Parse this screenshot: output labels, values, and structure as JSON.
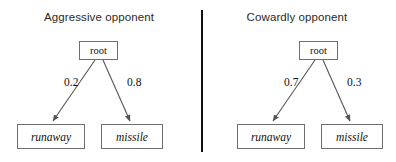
{
  "figure": {
    "background_color": "#ffffff",
    "line_color": "#555555",
    "box_border_color": "#6e6e6e",
    "divider_color": "#111111",
    "divider": "vertical-separator"
  },
  "panels": [
    {
      "id": "aggressive",
      "title": "Aggressive opponent",
      "root": {
        "label": "root"
      },
      "branches": [
        {
          "probability": "0.2",
          "target": "runaway"
        },
        {
          "probability": "0.8",
          "target": "missile"
        }
      ],
      "leaves": [
        {
          "id": "runaway",
          "label": "runaway"
        },
        {
          "id": "missile",
          "label": "missile"
        }
      ]
    },
    {
      "id": "cowardly",
      "title": "Cowardly opponent",
      "root": {
        "label": "root"
      },
      "branches": [
        {
          "probability": "0.7",
          "target": "runaway"
        },
        {
          "probability": "0.3",
          "target": "missile"
        }
      ],
      "leaves": [
        {
          "id": "runaway",
          "label": "runaway"
        },
        {
          "id": "missile",
          "label": "missile"
        }
      ]
    }
  ]
}
